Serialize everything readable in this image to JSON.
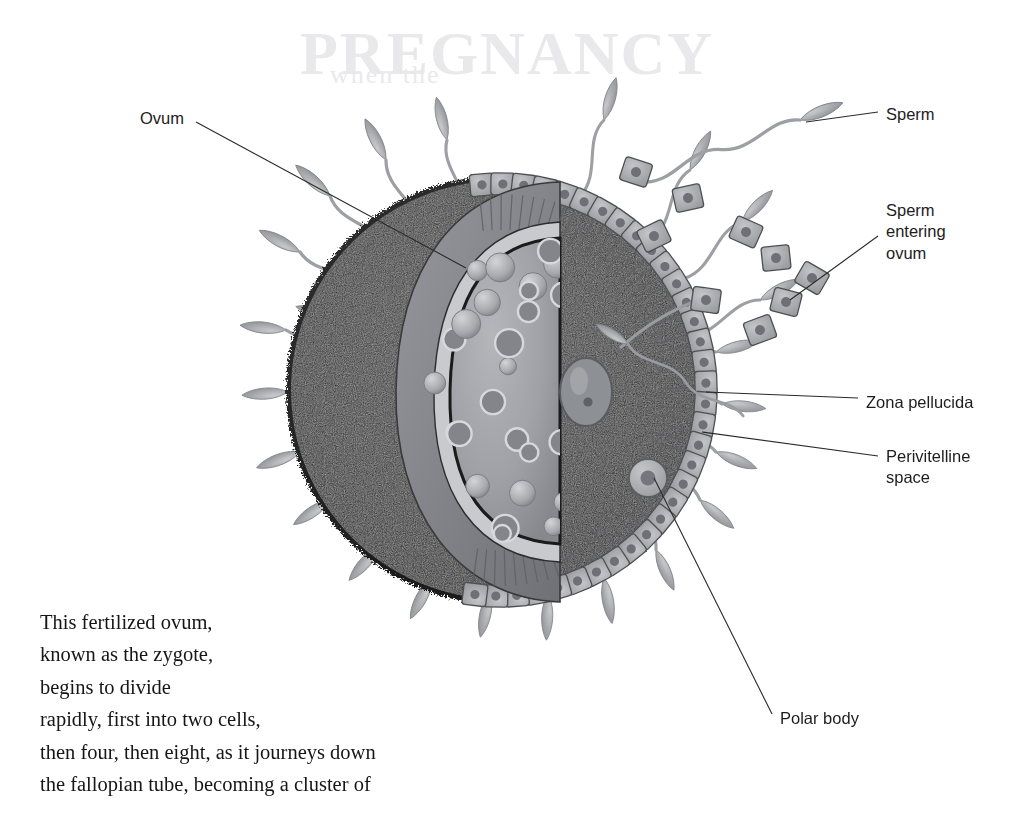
{
  "figure": {
    "title_ghost": "PREGNANCY",
    "background_color": "#ffffff"
  },
  "labels": [
    {
      "id": "ovum",
      "text": "Ovum",
      "x": 140,
      "y": 108,
      "align": "left"
    },
    {
      "id": "sperm",
      "text": "Sperm",
      "x": 886,
      "y": 104,
      "align": "left"
    },
    {
      "id": "sperm-entering",
      "text": "Sperm\nentering\novum",
      "x": 886,
      "y": 200,
      "align": "left"
    },
    {
      "id": "zona-pellucida",
      "text": "Zona pellucida",
      "x": 866,
      "y": 392,
      "align": "left"
    },
    {
      "id": "perivitelline",
      "text": "Perivitelline\nspace",
      "x": 886,
      "y": 446,
      "align": "left"
    },
    {
      "id": "polar-body",
      "text": "Polar body",
      "x": 780,
      "y": 708,
      "align": "left"
    }
  ],
  "leader_lines": [
    {
      "id": "leader-ovum",
      "from": [
        196,
        122
      ],
      "to": [
        466,
        268
      ]
    },
    {
      "id": "leader-sperm",
      "from": [
        878,
        112
      ],
      "to": [
        806,
        122
      ]
    },
    {
      "id": "leader-sperm-entering",
      "from": [
        878,
        236
      ],
      "to": [
        790,
        300
      ]
    },
    {
      "id": "leader-zona",
      "from": [
        858,
        398
      ],
      "to": [
        706,
        392
      ]
    },
    {
      "id": "leader-perivitelline",
      "from": [
        878,
        456
      ],
      "to": [
        702,
        432
      ]
    },
    {
      "id": "leader-polar-body",
      "from": [
        772,
        714
      ],
      "to": [
        654,
        478
      ]
    }
  ],
  "body_text": {
    "paragraph": "   This fertilized ovum,\nknown as the zygote,\nbegins to divide\nrapidly, first into two cells,\nthen four, then eight, as it journeys down\nthe fallopian tube, becoming a cluster of",
    "x": 40,
    "y": 610
  },
  "structures": [
    {
      "id": "corona-radiata",
      "name": "Corona radiata",
      "color": "#262626"
    },
    {
      "id": "corona-cells",
      "name": "Corona radiata cells",
      "color": "#a9aaad"
    },
    {
      "id": "zona-pellucida",
      "name": "Zona pellucida",
      "color": "#8a8c90"
    },
    {
      "id": "perivitelline-space",
      "name": "Perivitelline space",
      "color": "#c9cacd"
    },
    {
      "id": "ooplasm",
      "name": "Ooplasm",
      "color": "#9fa1a6"
    },
    {
      "id": "pronucleus",
      "name": "Pronucleus",
      "color": "#8d9095"
    },
    {
      "id": "polar-body",
      "name": "Polar body",
      "color": "#b1b3b7"
    },
    {
      "id": "sperm",
      "name": "Spermatozoa",
      "color": "#9b9da1"
    }
  ],
  "counts": {
    "sperm_surrounding": 26,
    "free_corona_cells": 9,
    "cortical_granules": 34
  },
  "geometry": {
    "ovum_center": [
      500,
      390
    ],
    "ovum_radius": 215,
    "cutaway_center": [
      560,
      388
    ]
  }
}
